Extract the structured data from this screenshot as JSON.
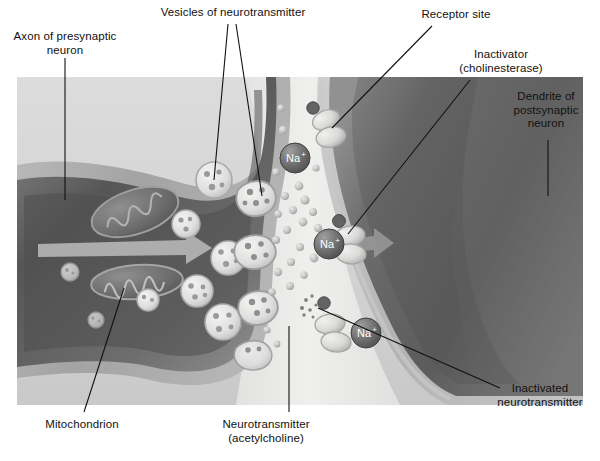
{
  "figure": {
    "panel_background": "#d4d4d4",
    "page_background": "#ffffff"
  },
  "labels": {
    "axon": {
      "text": "Axon of presynaptic\nneuron",
      "x": 6,
      "y": 30,
      "w": 118,
      "align": "center"
    },
    "vesicles": {
      "text": "Vesicles of neurotransmitter",
      "x": 138,
      "y": 6,
      "w": 190,
      "align": "center"
    },
    "receptor": {
      "text": "Receptor site",
      "x": 408,
      "y": 8,
      "w": 96,
      "align": "center"
    },
    "inactivator": {
      "text": "Inactivator\n(cholinesterase)",
      "x": 446,
      "y": 48,
      "w": 110,
      "align": "center"
    },
    "dendrite": {
      "text": "Dendrite of\npostsynaptic\nneuron",
      "x": 498,
      "y": 90,
      "w": 96,
      "align": "center"
    },
    "mitochondrion": {
      "text": "Mitochondrion",
      "x": 32,
      "y": 418,
      "w": 100,
      "align": "center"
    },
    "neurotransmitter": {
      "text": "Neurotransmitter\n(acetylcholine)",
      "x": 204,
      "y": 418,
      "w": 124,
      "align": "center"
    },
    "inactivated": {
      "text": "Inactivated\nneurotransmitter",
      "x": 484,
      "y": 382,
      "w": 112,
      "align": "center"
    }
  },
  "ions": [
    {
      "name": "sodium-ion-1",
      "text": "Na",
      "charge": "+",
      "cx": 295,
      "cy": 158,
      "r": 15
    },
    {
      "name": "sodium-ion-2",
      "text": "Na",
      "charge": "+",
      "cx": 329,
      "cy": 244,
      "r": 15
    },
    {
      "name": "sodium-ion-3",
      "text": "Na",
      "charge": "+",
      "cx": 366,
      "cy": 333,
      "r": 15
    }
  ],
  "colors": {
    "panel": "#d4d4d4",
    "panel_lower": "#cccccc",
    "axon_cytoplasm_dark": "#555555",
    "axon_cytoplasm_mid": "#6f6f6f",
    "axon_membrane": "#a8a8a8",
    "cleft": "#e8e8e6",
    "dendrite_dark": "#5a5a5a",
    "dendrite_mid": "#727272",
    "dendrite_membrane": "#b9b9b9",
    "vesicle_fill": "#e4e4e2",
    "vesicle_dot": "#9a9a9a",
    "ion_fill": "#6a6a6a",
    "ion_text": "#ffffff",
    "transmitter_dot": "#bdbdbd",
    "receptor_fill": "#dcdcda",
    "leader_line": "#111111",
    "arrow": "#b4b4b4"
  },
  "structures": {
    "mitochondria_count": 2,
    "vesicles_free_count": 8,
    "vesicles_fusing_count": 4,
    "receptor_sites_count": 3,
    "impulse_arrow_presynaptic": true,
    "impulse_arrow_postsynaptic": true
  }
}
